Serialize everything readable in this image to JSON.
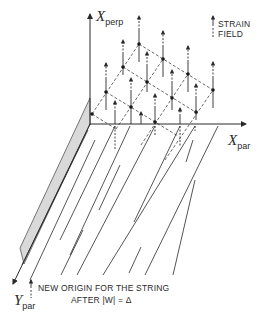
{
  "axes": {
    "x_perp": {
      "main": "X",
      "sub": "perp"
    },
    "x_par": {
      "main": "X",
      "sub": "par"
    },
    "y_par": {
      "main": "Y",
      "sub": "par"
    }
  },
  "legend": {
    "line1": "STRAIN",
    "line2": "FIELD",
    "icon": "dashed-up-arrow"
  },
  "caption": {
    "line1": "NEW ORIGIN FOR THE STRING",
    "line2": "AFTER  |W| = Δ"
  },
  "colors": {
    "ink": "#2a2a2a",
    "plane_fill": "#d9d9d9"
  },
  "lattice": {
    "origin": [
      92,
      114
    ],
    "step_i": [
      24.5,
      15.3
    ],
    "step_j": [
      15.7,
      -23.3
    ],
    "points": [
      [
        0,
        0
      ],
      [
        0,
        1
      ],
      [
        0,
        2
      ],
      [
        0,
        3
      ],
      [
        1,
        1
      ],
      [
        1,
        2
      ],
      [
        1,
        3
      ],
      [
        2,
        1
      ],
      [
        2,
        2
      ],
      [
        2,
        3
      ],
      [
        3,
        2
      ],
      [
        3,
        3
      ]
    ]
  }
}
